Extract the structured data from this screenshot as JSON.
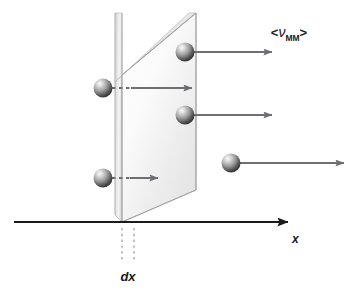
{
  "figure": {
    "background_color": "#ffffff"
  },
  "labels": {
    "velocity_open_bracket": "<",
    "velocity_symbol": "ν",
    "velocity_subscript": "MM",
    "velocity_close_bracket": ">",
    "velocity_full": "<νMM>",
    "axis_x": "x",
    "thickness": "dx"
  },
  "colors": {
    "axis": "#1a1a1a",
    "arrow": "#6e6e73",
    "slab_edge": "#8a8a8a",
    "slab_fill_light": "#fdfdfd",
    "slab_fill_dark": "#d9d9d9",
    "sphere_highlight": "#f2f2f2",
    "sphere_mid": "#9a9a9a",
    "sphere_dark": "#3f3f3f",
    "dashed_guide": "#9a9a9a",
    "text": "#1a1a1a"
  },
  "geometry": {
    "axis": {
      "x1": 14,
      "y1": 222,
      "x2": 290,
      "y2": 222,
      "arrow_size": 8
    },
    "slab": {
      "front_face": [
        [
          122,
          13
        ],
        [
          196,
          13
        ],
        [
          196,
          222
        ],
        [
          122,
          222
        ]
      ],
      "skew_top_x": 161,
      "depth_offset_x": -7,
      "thickness_px": 12
    },
    "dashed_lines": [
      {
        "x": 122,
        "y1": 228,
        "y2": 262
      },
      {
        "x": 134,
        "y1": 228,
        "y2": 262
      }
    ]
  },
  "molecules": [
    {
      "id": "molecule-top-inside",
      "cx": 185,
      "cy": 52,
      "r": 10,
      "arrow": {
        "x1": 192,
        "y1": 52,
        "x2": 278,
        "y2": 52,
        "dashed": false
      },
      "description": "sphere inside slab moving right"
    },
    {
      "id": "molecule-left-upper",
      "cx": 103,
      "cy": 88,
      "r": 10,
      "arrow": {
        "x1": 112,
        "y1": 88,
        "x2": 198,
        "y2": 88,
        "dashed": true
      },
      "description": "sphere left of slab entering slab"
    },
    {
      "id": "molecule-mid-inside",
      "cx": 185,
      "cy": 115,
      "r": 10,
      "arrow": {
        "x1": 192,
        "y1": 115,
        "x2": 278,
        "y2": 115,
        "dashed": false
      },
      "description": "sphere inside slab moving right"
    },
    {
      "id": "molecule-left-lower",
      "cx": 103,
      "cy": 178,
      "r": 10,
      "arrow": {
        "x1": 112,
        "y1": 178,
        "x2": 165,
        "y2": 178,
        "dashed": true
      },
      "description": "sphere left of slab short arrow"
    },
    {
      "id": "molecule-right-outside",
      "cx": 231,
      "cy": 163,
      "r": 10,
      "arrow": {
        "x1": 239,
        "y1": 163,
        "x2": 350,
        "y2": 163,
        "dashed": false
      },
      "description": "sphere right of slab long arrow"
    }
  ]
}
